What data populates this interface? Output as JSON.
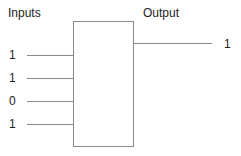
{
  "diagram": {
    "inputs_heading": "Inputs",
    "output_heading": "Output",
    "inputs": [
      {
        "label": "1",
        "y": 55
      },
      {
        "label": "1",
        "y": 78
      },
      {
        "label": "0",
        "y": 101
      },
      {
        "label": "1",
        "y": 124
      }
    ],
    "output": {
      "label": "1",
      "y": 43
    },
    "colors": {
      "line": "#8a8a8a",
      "text": "#222222"
    }
  }
}
